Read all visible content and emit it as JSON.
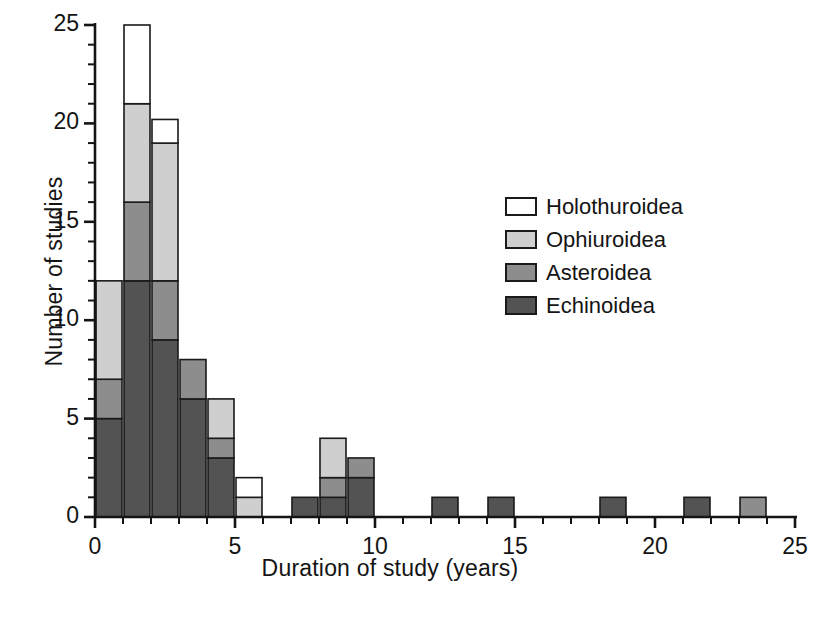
{
  "chart_data": {
    "type": "bar",
    "subtype": "stacked-histogram",
    "title": "",
    "xlabel": "Duration of study (years)",
    "ylabel": "Number of studies",
    "xlim": [
      0,
      25
    ],
    "ylim": [
      0,
      25
    ],
    "xticks": [
      0,
      1,
      2,
      3,
      4,
      5,
      6,
      7,
      8,
      9,
      10,
      11,
      12,
      13,
      14,
      15,
      16,
      17,
      18,
      19,
      20,
      21,
      22,
      23,
      24,
      25
    ],
    "xtick_labels": [
      "0",
      "5",
      "10",
      "15",
      "20",
      "25"
    ],
    "xtick_label_values": [
      0,
      5,
      10,
      15,
      20,
      25
    ],
    "yticks": [
      0,
      1,
      2,
      3,
      4,
      5,
      6,
      7,
      8,
      9,
      10,
      11,
      12,
      13,
      14,
      15,
      16,
      17,
      18,
      19,
      20,
      21,
      22,
      23,
      24,
      25
    ],
    "ytick_labels": [
      "0",
      "5",
      "10",
      "15",
      "20",
      "25"
    ],
    "ytick_label_values": [
      0,
      5,
      10,
      15,
      20,
      25
    ],
    "grid": false,
    "bin_width": 1,
    "bin_starts": [
      0,
      1,
      2,
      3,
      4,
      5,
      6,
      7,
      8,
      9,
      10,
      11,
      12,
      13,
      14,
      15,
      16,
      17,
      18,
      19,
      20,
      21,
      22,
      23,
      24
    ],
    "series": [
      {
        "name": "Echinoidea",
        "color": "#535353",
        "values": [
          5,
          12,
          9,
          6,
          3,
          0,
          0,
          1,
          1,
          2,
          0,
          0,
          1,
          0,
          1,
          0,
          0,
          0,
          1,
          0,
          0,
          1,
          0,
          0,
          0
        ]
      },
      {
        "name": "Asteroidea",
        "color": "#8d8d8d",
        "values": [
          2,
          4,
          3,
          2,
          1,
          0,
          0,
          0,
          1,
          1,
          0,
          0,
          0,
          0,
          0,
          0,
          0,
          0,
          0,
          0,
          0,
          0,
          0,
          1,
          0
        ]
      },
      {
        "name": "Ophiuroidea",
        "color": "#cfcfcf",
        "values": [
          5,
          5,
          7,
          0,
          2,
          1,
          0,
          0,
          2,
          0,
          0,
          0,
          0,
          0,
          0,
          0,
          0,
          0,
          0,
          0,
          0,
          0,
          0,
          0,
          0
        ]
      },
      {
        "name": "Holothuroidea",
        "color": "#ffffff",
        "values": [
          0,
          4,
          1.2,
          0,
          0,
          1,
          0,
          0,
          0,
          0,
          0,
          0,
          0,
          0,
          0,
          0,
          0,
          0,
          0,
          0,
          0,
          0,
          0,
          0,
          0
        ]
      }
    ],
    "totals": [
      12,
      25,
      20.2,
      8,
      6,
      2,
      0,
      1,
      4,
      3,
      0,
      0,
      1,
      0,
      1,
      0,
      0,
      0,
      1,
      0,
      0,
      1,
      0,
      1,
      0
    ],
    "legend": {
      "position": "right-upper",
      "entries": [
        {
          "label": "Holothuroidea",
          "color": "#ffffff"
        },
        {
          "label": "Ophiuroidea",
          "color": "#cfcfcf"
        },
        {
          "label": "Asteroidea",
          "color": "#8d8d8d"
        },
        {
          "label": "Echinoidea",
          "color": "#535353"
        }
      ]
    }
  }
}
